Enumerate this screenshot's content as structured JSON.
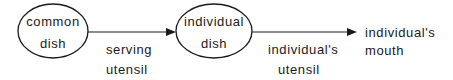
{
  "diagram": {
    "nodes": [
      {
        "id": "common-dish",
        "line1": "common",
        "line2": "dish",
        "shape": "ellipse"
      },
      {
        "id": "individual-dish",
        "line1": "individual",
        "line2": "dish",
        "shape": "ellipse"
      },
      {
        "id": "individuals-mouth",
        "line1": "individual's",
        "line2": "mouth",
        "shape": "none"
      }
    ],
    "edges": [
      {
        "from": "common-dish",
        "to": "individual-dish",
        "line1": "serving",
        "line2": "utensil"
      },
      {
        "from": "individual-dish",
        "to": "individuals-mouth",
        "line1": "individual's",
        "line2": "utensil"
      }
    ],
    "colors": {
      "stroke": "#1a1a1a",
      "background": "#ffffff"
    }
  }
}
